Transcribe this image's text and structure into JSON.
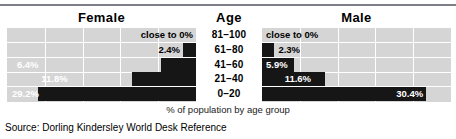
{
  "chart_data": {
    "type": "bar",
    "title": "",
    "subtitle": "",
    "xlabel": "% of population by age group",
    "ylabel": "Age",
    "orientation": "horizontal",
    "layout": "population-pyramid",
    "grid": true,
    "legend_position": "none",
    "xlim": [
      0,
      35
    ],
    "gridline_count": 5,
    "categories": [
      "81–100",
      "61–80",
      "41–60",
      "21–40",
      "0–20"
    ],
    "series": [
      {
        "name": "Female",
        "side": "left",
        "values": [
          0,
          2.4,
          6.4,
          11.8,
          29.2
        ],
        "labels": [
          "close to 0%",
          "2.4%",
          "6.4%",
          "11.8%",
          "29.2%"
        ],
        "label_inside": [
          false,
          false,
          true,
          true,
          true
        ]
      },
      {
        "name": "Male",
        "side": "right",
        "values": [
          0,
          2.3,
          5.9,
          11.6,
          30.4
        ],
        "labels": [
          "close to 0%",
          "2.3%",
          "5.9%",
          "11.6%",
          "30.4%"
        ],
        "label_inside": [
          false,
          false,
          true,
          true,
          true
        ]
      }
    ],
    "colors": {
      "bar": "#161616",
      "panel_background": "#d5d5d5",
      "gridline": "#ffffff",
      "rule": "#7c8086",
      "label_on_bar": "#ffffff",
      "label_off_bar": "#000000"
    }
  },
  "headers": {
    "female": "Female",
    "age": "Age",
    "male": "Male"
  },
  "footer": {
    "caption": "% of population by age group",
    "source": "Source:  Dorling Kindersley World Desk Reference"
  }
}
